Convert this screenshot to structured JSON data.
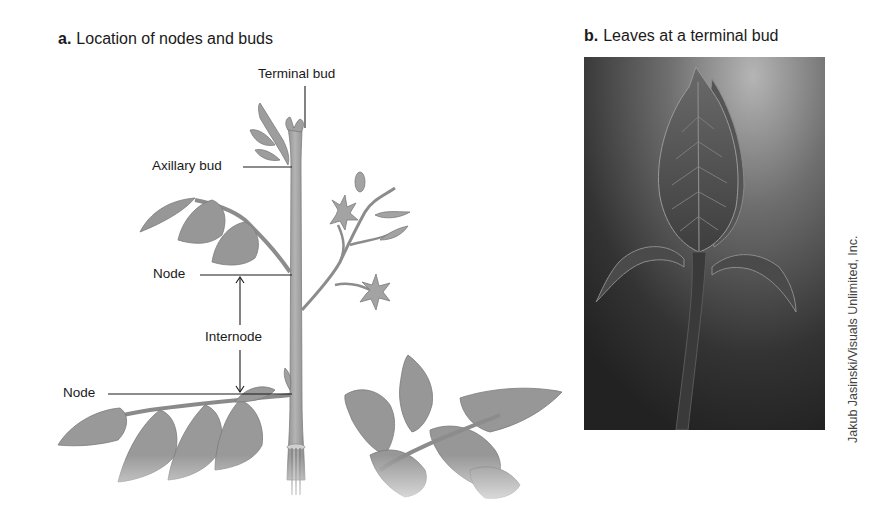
{
  "panel_a": {
    "letter": "a.",
    "title": "Location of nodes and buds",
    "labels": {
      "terminal_bud": "Terminal bud",
      "axillary_bud": "Axillary bud",
      "node_upper": "Node",
      "internode": "Internode",
      "node_lower": "Node"
    }
  },
  "panel_b": {
    "letter": "b.",
    "title": "Leaves at a terminal bud",
    "photo_credit": "Jakub Jasinski/Visuals Unlimited, Inc."
  },
  "colors": {
    "plant_fill": "#9a9a9a",
    "plant_dark": "#7d7d7d",
    "stem_fill": "#a8a8a8",
    "label_text": "#1a1a1a",
    "photo_bg_top": "#9b9b9b",
    "photo_bg_bottom": "#2a2a2a"
  }
}
